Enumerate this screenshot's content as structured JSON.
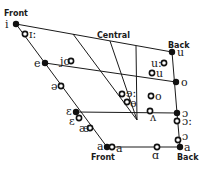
{
  "diagram": {
    "type": "vowel-quadrilateral",
    "labels": {
      "front_top": "Front",
      "central": "Central",
      "back_top": "Back",
      "front_bottom": "Front",
      "back_bottom": "Back"
    },
    "cardinal_vowels": [
      {
        "symbol": "i",
        "x": 16,
        "y": 24,
        "type": "filled",
        "lx": 5,
        "ly": 28
      },
      {
        "symbol": "e",
        "x": 45,
        "y": 63,
        "type": "filled",
        "lx": 34,
        "ly": 67
      },
      {
        "symbol": "ɛ",
        "x": 76,
        "y": 112,
        "type": "filled",
        "lx": 66,
        "ly": 115
      },
      {
        "symbol": "a",
        "x": 107,
        "y": 147,
        "type": "filled",
        "lx": 97,
        "ly": 150
      },
      {
        "symbol": "u",
        "x": 172,
        "y": 52,
        "type": "filled",
        "lx": 177,
        "ly": 56
      },
      {
        "symbol": "o",
        "x": 176,
        "y": 82,
        "type": "filled",
        "lx": 181,
        "ly": 86
      },
      {
        "symbol": "ɔ",
        "x": 177,
        "y": 113,
        "type": "filled",
        "lx": 182,
        "ly": 117
      },
      {
        "symbol": "a",
        "x": 180,
        "y": 147,
        "type": "filled",
        "lx": 184,
        "ly": 151
      }
    ],
    "language_vowels": [
      {
        "symbol": "ɪ:",
        "x": 25,
        "y": 34,
        "type": "open",
        "lx": 29,
        "ly": 38
      },
      {
        "symbol": "jo",
        "x": 71,
        "y": 61,
        "type": "open",
        "lx": 60,
        "ly": 65
      },
      {
        "symbol": "ə",
        "x": 61,
        "y": 86,
        "type": "open",
        "lx": 51,
        "ly": 90
      },
      {
        "symbol": "ɛ",
        "x": 79,
        "y": 118,
        "type": "open",
        "lx": 69,
        "ly": 125
      },
      {
        "symbol": "æ",
        "x": 90,
        "y": 128,
        "type": "open",
        "lx": 79,
        "ly": 132
      },
      {
        "symbol": "a",
        "x": 112,
        "y": 147,
        "type": "open",
        "lx": 116,
        "ly": 152
      },
      {
        "symbol": "ɑ",
        "x": 157,
        "y": 147,
        "type": "open",
        "lx": 152,
        "ly": 159
      },
      {
        "symbol": "ɔ",
        "x": 178,
        "y": 140,
        "type": "open",
        "lx": 182,
        "ly": 140
      },
      {
        "symbol": "ɔ:",
        "x": 177,
        "y": 121,
        "type": "open",
        "lx": 182,
        "ly": 125
      },
      {
        "symbol": "ʌ",
        "x": 150,
        "y": 111,
        "type": "open",
        "lx": 150,
        "ly": 121
      },
      {
        "symbol": "ɘ:",
        "x": 122,
        "y": 94,
        "type": "open",
        "lx": 126,
        "ly": 97
      },
      {
        "symbol": "ɵ",
        "x": 127,
        "y": 102,
        "type": "open",
        "lx": 130,
        "ly": 107
      },
      {
        "symbol": "o",
        "x": 151,
        "y": 96,
        "type": "open",
        "lx": 155,
        "ly": 100
      },
      {
        "symbol": "u:",
        "x": 164,
        "y": 63,
        "type": "open",
        "lx": 151,
        "ly": 67
      },
      {
        "symbol": "u",
        "x": 152,
        "y": 73,
        "type": "open",
        "lx": 156,
        "ly": 77
      }
    ]
  }
}
